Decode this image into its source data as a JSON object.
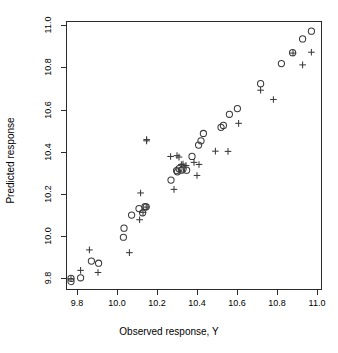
{
  "chart_data": {
    "type": "scatter",
    "title": "",
    "xlabel": "Observed response, Y",
    "ylabel": "Predicted response",
    "xlim": [
      9.745,
      11.025
    ],
    "ylim": [
      9.745,
      11.02
    ],
    "xticks": [
      9.8,
      10.0,
      10.2,
      10.4,
      10.6,
      10.8,
      11.0
    ],
    "xticklabels": [
      "9.8",
      "10.0",
      "10.2",
      "10.4",
      "10.6",
      "10.8",
      "11.0"
    ],
    "yticks": [
      9.8,
      10.0,
      10.2,
      10.4,
      10.6,
      10.8,
      11.0
    ],
    "yticklabels": [
      "9.8",
      "10.0",
      "10.2",
      "10.4",
      "10.6",
      "10.8",
      "11.0"
    ],
    "grid": false,
    "legend": null,
    "marker_color": "#3a3a3a",
    "frame_color": "#2b2b2b",
    "series": [
      {
        "name": "circle-series",
        "marker": "open-circle",
        "points": [
          [
            9.77,
            9.8
          ],
          [
            9.77,
            9.785
          ],
          [
            9.818,
            9.803
          ],
          [
            9.872,
            9.882
          ],
          [
            9.908,
            9.872
          ],
          [
            10.032,
            9.995
          ],
          [
            10.035,
            10.038
          ],
          [
            10.073,
            10.1
          ],
          [
            10.11,
            10.131
          ],
          [
            10.128,
            10.111
          ],
          [
            10.14,
            10.14
          ],
          [
            10.146,
            10.139
          ],
          [
            10.27,
            10.266
          ],
          [
            10.298,
            10.311
          ],
          [
            10.302,
            10.305
          ],
          [
            10.31,
            10.32
          ],
          [
            10.322,
            10.313
          ],
          [
            10.33,
            10.318
          ],
          [
            10.348,
            10.313
          ],
          [
            10.375,
            10.378
          ],
          [
            10.408,
            10.432
          ],
          [
            10.42,
            10.452
          ],
          [
            10.432,
            10.487
          ],
          [
            10.52,
            10.516
          ],
          [
            10.532,
            10.525
          ],
          [
            10.562,
            10.578
          ],
          [
            10.602,
            10.605
          ],
          [
            10.718,
            10.723
          ],
          [
            10.822,
            10.818
          ],
          [
            10.878,
            10.87
          ],
          [
            10.928,
            10.935
          ],
          [
            10.972,
            10.972
          ]
        ]
      },
      {
        "name": "plus-series",
        "marker": "plus",
        "points": [
          [
            9.77,
            9.798
          ],
          [
            9.818,
            9.838
          ],
          [
            9.862,
            9.935
          ],
          [
            9.905,
            9.828
          ],
          [
            10.062,
            9.922
          ],
          [
            10.113,
            10.078
          ],
          [
            10.118,
            10.205
          ],
          [
            10.13,
            10.113
          ],
          [
            10.146,
            10.138
          ],
          [
            10.148,
            10.458
          ],
          [
            10.148,
            10.452
          ],
          [
            10.268,
            10.378
          ],
          [
            10.285,
            10.222
          ],
          [
            10.3,
            10.382
          ],
          [
            10.31,
            10.375
          ],
          [
            10.322,
            10.34
          ],
          [
            10.33,
            10.342
          ],
          [
            10.345,
            10.335
          ],
          [
            10.385,
            10.35
          ],
          [
            10.4,
            10.288
          ],
          [
            10.41,
            10.34
          ],
          [
            10.492,
            10.403
          ],
          [
            10.555,
            10.402
          ],
          [
            10.608,
            10.535
          ],
          [
            10.718,
            10.692
          ],
          [
            10.782,
            10.648
          ],
          [
            10.88,
            10.868
          ],
          [
            10.928,
            10.812
          ],
          [
            10.972,
            10.872
          ]
        ]
      }
    ]
  }
}
